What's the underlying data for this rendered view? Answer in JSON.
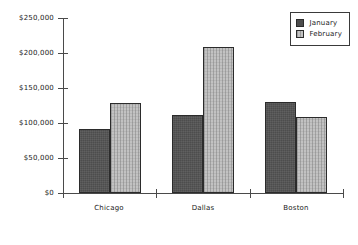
{
  "chart_data": {
    "type": "bar",
    "title": "",
    "subtitle": "",
    "xlabel": "",
    "ylabel": "",
    "categories": [
      "Chicago",
      "Dallas",
      "Boston"
    ],
    "series": [
      {
        "name": "January",
        "values": [
          92000,
          112000,
          130000
        ],
        "color": "#4d4d4d"
      },
      {
        "name": "February",
        "values": [
          128000,
          209000,
          108000
        ],
        "color": "#c2c2c2"
      }
    ],
    "ylim": [
      0,
      250000
    ],
    "yticks": [
      0,
      50000,
      100000,
      150000,
      200000,
      250000
    ],
    "ytick_labels": [
      "$0",
      "$50,000",
      "$100,000",
      "$150,000",
      "$200,000",
      "$250,000"
    ],
    "grid": false,
    "legend_position": "top-right",
    "legend_entries": [
      "January",
      "February"
    ]
  },
  "axes": {
    "y_tick_labels": [
      "$250,000",
      "$200,000",
      "$150,000",
      "$100,000",
      "$50,000",
      "$0"
    ],
    "x_category_labels": [
      "Chicago",
      "Dallas",
      "Boston"
    ]
  },
  "legend": {
    "items": [
      {
        "label": "January"
      },
      {
        "label": "February"
      }
    ]
  }
}
